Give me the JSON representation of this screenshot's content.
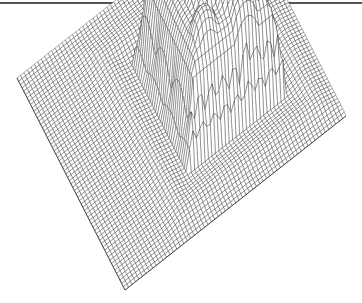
{
  "chart_data": {
    "type": "surface-wireframe",
    "title": "",
    "xlabel": "",
    "ylabel": "",
    "zlabel": "",
    "grid": true,
    "legend": null,
    "grid_size": [
      64,
      64
    ],
    "baseline_height": 0,
    "plateau": {
      "center": [
        0.52,
        0.38
      ],
      "half_extent": [
        0.26,
        0.22
      ],
      "height": 1.0,
      "lobes": [
        {
          "center": [
            0.36,
            0.22
          ],
          "radius": 0.07,
          "height": 1.05
        },
        {
          "center": [
            0.48,
            0.18
          ],
          "radius": 0.06,
          "height": 1.08
        },
        {
          "center": [
            0.58,
            0.17
          ],
          "radius": 0.05,
          "height": 1.05
        },
        {
          "center": [
            0.4,
            0.35
          ],
          "radius": 0.09,
          "height": 1.0
        },
        {
          "center": [
            0.55,
            0.42
          ],
          "radius": 0.09,
          "height": 0.95
        },
        {
          "center": [
            0.66,
            0.48
          ],
          "radius": 0.07,
          "height": 0.9
        },
        {
          "center": [
            0.7,
            0.32
          ],
          "radius": 0.07,
          "height": 0.9
        },
        {
          "center": [
            0.6,
            0.3
          ],
          "radius": 0.13,
          "height": 1.1
        }
      ]
    },
    "projection": {
      "corner_left": [
        17,
        78
      ],
      "corner_bottom": [
        125,
        290
      ],
      "corner_right": [
        346,
        116
      ],
      "height_scale": 120
    },
    "line_color": "#222222",
    "background": "#ffffff"
  }
}
